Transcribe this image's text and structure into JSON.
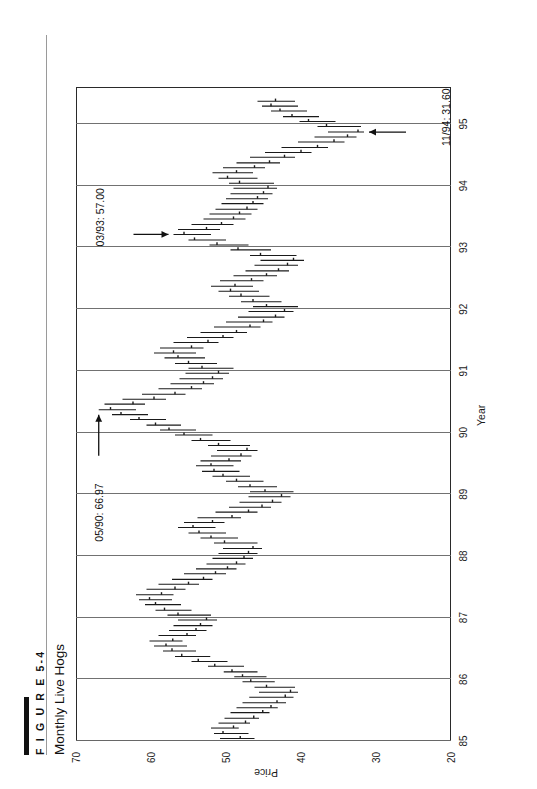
{
  "figure": {
    "number_label": "F I G U R E  5-4",
    "number_plain": "FIGURE 5-4",
    "title": "Monthly Live Hogs"
  },
  "chart_data": {
    "type": "bar",
    "subtype": "high-low-close price bars (monthly OHLC style, rotated 90 degrees)",
    "title": "Monthly Live Hogs",
    "xlabel": "Year",
    "ylabel": "Price",
    "xlim": [
      85,
      95.6
    ],
    "ylim": [
      20,
      70
    ],
    "ytick_labels": [
      "70",
      "60",
      "50",
      "40",
      "30",
      "20"
    ],
    "ytick_values": [
      70,
      60,
      50,
      40,
      30,
      20
    ],
    "xtick_labels": [
      "85",
      "86",
      "87",
      "88",
      "89",
      "90",
      "91",
      "92",
      "93",
      "94",
      "95"
    ],
    "xtick_values": [
      85,
      86,
      87,
      88,
      89,
      90,
      91,
      92,
      93,
      94,
      95
    ],
    "grid": "solid vertical price gridlines at 60, 50, 40, 30; dotted year gridlines",
    "gridlines_price": [
      60,
      50,
      40,
      30
    ],
    "legend": "none",
    "series_name": "Live Hogs monthly high-low-close",
    "annotations": [
      {
        "label": "05/90: 66.97",
        "date": "05/90",
        "value": 66.97,
        "arrow": "up"
      },
      {
        "label": "03/93: 57.00",
        "date": "03/93",
        "value": 57.0,
        "arrow": "right"
      },
      {
        "label": "11/94: 31.60",
        "date": "11/94",
        "value": 31.6,
        "arrow": "left"
      }
    ],
    "bars": [
      {
        "t": 85.04,
        "high": 50.8,
        "low": 46.2,
        "close": 48.1
      },
      {
        "t": 85.12,
        "high": 51.6,
        "low": 47.0,
        "close": 50.4
      },
      {
        "t": 85.21,
        "high": 52.0,
        "low": 48.3,
        "close": 49.0
      },
      {
        "t": 85.29,
        "high": 51.0,
        "low": 46.8,
        "close": 47.4
      },
      {
        "t": 85.37,
        "high": 50.2,
        "low": 45.6,
        "close": 46.3
      },
      {
        "t": 85.46,
        "high": 49.4,
        "low": 44.2,
        "close": 45.1
      },
      {
        "t": 85.54,
        "high": 48.6,
        "low": 43.1,
        "close": 44.0
      },
      {
        "t": 85.62,
        "high": 47.8,
        "low": 42.0,
        "close": 43.2
      },
      {
        "t": 85.71,
        "high": 46.9,
        "low": 41.0,
        "close": 42.1
      },
      {
        "t": 85.79,
        "high": 45.6,
        "low": 40.4,
        "close": 41.4
      },
      {
        "t": 85.87,
        "high": 46.2,
        "low": 40.8,
        "close": 44.6
      },
      {
        "t": 85.96,
        "high": 47.8,
        "low": 43.5,
        "close": 46.7
      },
      {
        "t": 86.04,
        "high": 48.9,
        "low": 44.6,
        "close": 47.8
      },
      {
        "t": 86.12,
        "high": 50.3,
        "low": 45.8,
        "close": 49.2
      },
      {
        "t": 86.21,
        "high": 52.4,
        "low": 47.6,
        "close": 51.5
      },
      {
        "t": 86.29,
        "high": 54.6,
        "low": 49.8,
        "close": 53.7
      },
      {
        "t": 86.37,
        "high": 56.8,
        "low": 52.1,
        "close": 55.9
      },
      {
        "t": 86.46,
        "high": 58.4,
        "low": 54.0,
        "close": 57.2
      },
      {
        "t": 86.54,
        "high": 59.6,
        "low": 55.2,
        "close": 58.0
      },
      {
        "t": 86.62,
        "high": 60.2,
        "low": 55.8,
        "close": 57.1
      },
      {
        "t": 86.71,
        "high": 59.0,
        "low": 54.0,
        "close": 55.2
      },
      {
        "t": 86.79,
        "high": 57.6,
        "low": 52.6,
        "close": 54.0
      },
      {
        "t": 86.87,
        "high": 57.0,
        "low": 51.8,
        "close": 53.4
      },
      {
        "t": 86.96,
        "high": 56.4,
        "low": 51.2,
        "close": 52.6
      },
      {
        "t": 87.04,
        "high": 57.8,
        "low": 52.0,
        "close": 56.4
      },
      {
        "t": 87.12,
        "high": 59.4,
        "low": 54.6,
        "close": 58.2
      },
      {
        "t": 87.21,
        "high": 60.8,
        "low": 56.0,
        "close": 59.4
      },
      {
        "t": 87.29,
        "high": 61.6,
        "low": 57.2,
        "close": 60.2
      },
      {
        "t": 87.37,
        "high": 62.0,
        "low": 57.0,
        "close": 58.6
      },
      {
        "t": 87.46,
        "high": 60.6,
        "low": 55.4,
        "close": 56.8
      },
      {
        "t": 87.54,
        "high": 59.0,
        "low": 53.6,
        "close": 55.0
      },
      {
        "t": 87.62,
        "high": 57.2,
        "low": 51.8,
        "close": 53.0
      },
      {
        "t": 87.71,
        "high": 55.6,
        "low": 50.0,
        "close": 51.4
      },
      {
        "t": 87.79,
        "high": 54.0,
        "low": 48.6,
        "close": 49.8
      },
      {
        "t": 87.87,
        "high": 52.6,
        "low": 47.4,
        "close": 48.6
      },
      {
        "t": 87.96,
        "high": 51.8,
        "low": 46.4,
        "close": 47.6
      },
      {
        "t": 88.04,
        "high": 51.0,
        "low": 45.8,
        "close": 47.0
      },
      {
        "t": 88.12,
        "high": 50.4,
        "low": 45.2,
        "close": 46.4
      },
      {
        "t": 88.21,
        "high": 51.6,
        "low": 45.8,
        "close": 50.2
      },
      {
        "t": 88.29,
        "high": 53.4,
        "low": 48.4,
        "close": 52.0
      },
      {
        "t": 88.37,
        "high": 55.0,
        "low": 50.0,
        "close": 53.6
      },
      {
        "t": 88.46,
        "high": 56.4,
        "low": 51.4,
        "close": 54.4
      },
      {
        "t": 88.54,
        "high": 55.6,
        "low": 50.2,
        "close": 51.8
      },
      {
        "t": 88.62,
        "high": 53.8,
        "low": 48.0,
        "close": 49.2
      },
      {
        "t": 88.71,
        "high": 51.4,
        "low": 45.8,
        "close": 47.0
      },
      {
        "t": 88.79,
        "high": 49.6,
        "low": 44.0,
        "close": 45.2
      },
      {
        "t": 88.87,
        "high": 48.2,
        "low": 42.6,
        "close": 43.8
      },
      {
        "t": 88.96,
        "high": 47.0,
        "low": 41.4,
        "close": 42.6
      },
      {
        "t": 89.04,
        "high": 46.8,
        "low": 41.0,
        "close": 44.8
      },
      {
        "t": 89.12,
        "high": 48.4,
        "low": 43.2,
        "close": 46.8
      },
      {
        "t": 89.21,
        "high": 50.0,
        "low": 45.0,
        "close": 48.6
      },
      {
        "t": 89.29,
        "high": 51.8,
        "low": 46.8,
        "close": 50.4
      },
      {
        "t": 89.37,
        "high": 53.2,
        "low": 48.2,
        "close": 51.6
      },
      {
        "t": 89.46,
        "high": 54.0,
        "low": 49.0,
        "close": 52.0
      },
      {
        "t": 89.54,
        "high": 53.4,
        "low": 48.0,
        "close": 49.6
      },
      {
        "t": 89.62,
        "high": 52.0,
        "low": 46.6,
        "close": 48.0
      },
      {
        "t": 89.71,
        "high": 51.2,
        "low": 45.8,
        "close": 47.2
      },
      {
        "t": 89.79,
        "high": 52.4,
        "low": 46.8,
        "close": 51.0
      },
      {
        "t": 89.87,
        "high": 54.6,
        "low": 49.4,
        "close": 53.4
      },
      {
        "t": 89.96,
        "high": 56.8,
        "low": 51.8,
        "close": 55.6
      },
      {
        "t": 90.04,
        "high": 58.8,
        "low": 54.0,
        "close": 57.6
      },
      {
        "t": 90.12,
        "high": 60.6,
        "low": 56.0,
        "close": 59.4
      },
      {
        "t": 90.21,
        "high": 62.8,
        "low": 58.0,
        "close": 61.6
      },
      {
        "t": 90.29,
        "high": 65.2,
        "low": 60.4,
        "close": 64.0
      },
      {
        "t": 90.37,
        "high": 66.97,
        "low": 62.0,
        "close": 65.4
      },
      {
        "t": 90.46,
        "high": 66.2,
        "low": 60.8,
        "close": 62.4
      },
      {
        "t": 90.54,
        "high": 63.8,
        "low": 58.0,
        "close": 59.6
      },
      {
        "t": 90.62,
        "high": 61.2,
        "low": 55.4,
        "close": 56.8
      },
      {
        "t": 90.71,
        "high": 59.0,
        "low": 53.2,
        "close": 54.6
      },
      {
        "t": 90.79,
        "high": 57.4,
        "low": 51.6,
        "close": 53.0
      },
      {
        "t": 90.87,
        "high": 56.2,
        "low": 50.4,
        "close": 51.8
      },
      {
        "t": 90.96,
        "high": 55.4,
        "low": 49.6,
        "close": 51.0
      },
      {
        "t": 91.04,
        "high": 55.0,
        "low": 49.0,
        "close": 53.2
      },
      {
        "t": 91.12,
        "high": 56.8,
        "low": 51.2,
        "close": 55.0
      },
      {
        "t": 91.21,
        "high": 58.2,
        "low": 52.8,
        "close": 56.4
      },
      {
        "t": 91.29,
        "high": 59.6,
        "low": 54.0,
        "close": 57.0
      },
      {
        "t": 91.37,
        "high": 58.8,
        "low": 53.0,
        "close": 54.6
      },
      {
        "t": 91.46,
        "high": 57.0,
        "low": 51.0,
        "close": 52.4
      },
      {
        "t": 91.54,
        "high": 55.2,
        "low": 49.0,
        "close": 50.4
      },
      {
        "t": 91.62,
        "high": 53.4,
        "low": 47.2,
        "close": 48.6
      },
      {
        "t": 91.71,
        "high": 51.6,
        "low": 45.4,
        "close": 46.8
      },
      {
        "t": 91.79,
        "high": 50.0,
        "low": 43.8,
        "close": 45.0
      },
      {
        "t": 91.87,
        "high": 48.4,
        "low": 42.2,
        "close": 43.4
      },
      {
        "t": 91.96,
        "high": 47.0,
        "low": 41.0,
        "close": 42.2
      },
      {
        "t": 92.04,
        "high": 46.4,
        "low": 40.4,
        "close": 44.6
      },
      {
        "t": 92.12,
        "high": 48.0,
        "low": 42.6,
        "close": 46.4
      },
      {
        "t": 92.21,
        "high": 49.6,
        "low": 44.2,
        "close": 48.0
      },
      {
        "t": 92.29,
        "high": 51.0,
        "low": 45.6,
        "close": 49.4
      },
      {
        "t": 92.37,
        "high": 52.0,
        "low": 46.4,
        "close": 48.8
      },
      {
        "t": 92.46,
        "high": 50.8,
        "low": 45.0,
        "close": 46.6
      },
      {
        "t": 92.54,
        "high": 49.0,
        "low": 43.2,
        "close": 44.6
      },
      {
        "t": 92.62,
        "high": 47.4,
        "low": 41.6,
        "close": 43.0
      },
      {
        "t": 92.71,
        "high": 46.2,
        "low": 40.4,
        "close": 41.8
      },
      {
        "t": 92.79,
        "high": 45.4,
        "low": 39.6,
        "close": 41.0
      },
      {
        "t": 92.87,
        "high": 46.8,
        "low": 40.6,
        "close": 45.4
      },
      {
        "t": 92.96,
        "high": 49.4,
        "low": 44.0,
        "close": 48.4
      },
      {
        "t": 93.04,
        "high": 52.2,
        "low": 47.0,
        "close": 51.2
      },
      {
        "t": 93.12,
        "high": 55.0,
        "low": 50.0,
        "close": 54.2
      },
      {
        "t": 93.21,
        "high": 57.0,
        "low": 52.0,
        "close": 55.6
      },
      {
        "t": 93.29,
        "high": 56.4,
        "low": 50.8,
        "close": 52.6
      },
      {
        "t": 93.37,
        "high": 54.6,
        "low": 49.0,
        "close": 50.6
      },
      {
        "t": 93.46,
        "high": 53.0,
        "low": 47.4,
        "close": 49.0
      },
      {
        "t": 93.54,
        "high": 52.2,
        "low": 46.6,
        "close": 48.2
      },
      {
        "t": 93.62,
        "high": 51.4,
        "low": 45.8,
        "close": 47.2
      },
      {
        "t": 93.71,
        "high": 50.6,
        "low": 45.0,
        "close": 46.4
      },
      {
        "t": 93.79,
        "high": 50.0,
        "low": 44.4,
        "close": 45.8
      },
      {
        "t": 93.87,
        "high": 49.4,
        "low": 43.8,
        "close": 45.0
      },
      {
        "t": 93.96,
        "high": 49.0,
        "low": 43.2,
        "close": 44.4
      },
      {
        "t": 94.04,
        "high": 49.6,
        "low": 43.6,
        "close": 48.2
      },
      {
        "t": 94.12,
        "high": 51.0,
        "low": 45.8,
        "close": 49.8
      },
      {
        "t": 94.21,
        "high": 51.8,
        "low": 46.4,
        "close": 48.6
      },
      {
        "t": 94.29,
        "high": 50.4,
        "low": 44.8,
        "close": 46.2
      },
      {
        "t": 94.37,
        "high": 48.6,
        "low": 42.8,
        "close": 44.2
      },
      {
        "t": 94.46,
        "high": 46.8,
        "low": 40.8,
        "close": 42.2
      },
      {
        "t": 94.54,
        "high": 44.8,
        "low": 38.6,
        "close": 40.0
      },
      {
        "t": 94.62,
        "high": 42.6,
        "low": 36.4,
        "close": 37.8
      },
      {
        "t": 94.71,
        "high": 40.4,
        "low": 34.2,
        "close": 35.6
      },
      {
        "t": 94.79,
        "high": 38.2,
        "low": 32.6,
        "close": 33.8
      },
      {
        "t": 94.87,
        "high": 36.4,
        "low": 31.6,
        "close": 32.4
      },
      {
        "t": 94.96,
        "high": 37.8,
        "low": 32.0,
        "close": 36.6
      },
      {
        "t": 95.04,
        "high": 40.2,
        "low": 35.4,
        "close": 39.0
      },
      {
        "t": 95.12,
        "high": 42.4,
        "low": 37.6,
        "close": 41.2
      },
      {
        "t": 95.21,
        "high": 44.0,
        "low": 39.2,
        "close": 42.8
      },
      {
        "t": 95.29,
        "high": 45.2,
        "low": 40.4,
        "close": 44.0
      },
      {
        "t": 95.37,
        "high": 45.8,
        "low": 40.8,
        "close": 43.4
      }
    ]
  }
}
